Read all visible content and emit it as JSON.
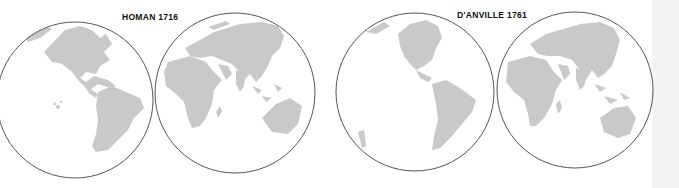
{
  "figure": {
    "type": "historical world maps comparison",
    "maps": [
      {
        "title": "HOMAN 1716",
        "hemispheres": [
          "western",
          "eastern"
        ]
      },
      {
        "title": "D'ANVILLE 1761",
        "hemispheres": [
          "western",
          "eastern"
        ]
      }
    ]
  },
  "colors": {
    "land": "#c9c9c9",
    "sea": "#ffffff",
    "outline": "#555555",
    "side_strip": "#f3f3f3"
  }
}
